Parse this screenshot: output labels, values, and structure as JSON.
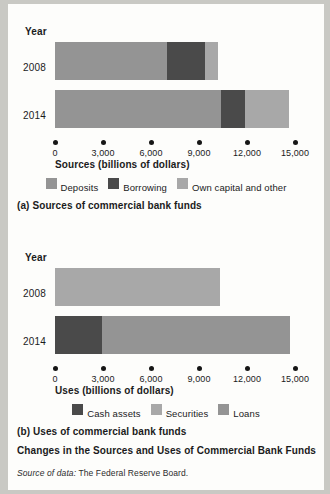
{
  "figure": {
    "main_caption": "Changes in the Sources and Uses of Commercial Bank Funds",
    "source_note_lead": "Source of data:",
    "source_note_rest": " The Federal Reserve Board."
  },
  "colors": {
    "dark": "#4a4a4a",
    "mid": "#949494",
    "light": "#a8a8a8",
    "text": "#1b1b1b",
    "page": "#fdfdfb",
    "backdrop": "#c9c9c4"
  },
  "chart_data": [
    {
      "id": "sources",
      "type": "bar",
      "orientation": "horizontal",
      "stacked": true,
      "title": "(a) Sources of commercial bank funds",
      "year_axis_label": "Year",
      "xlabel": "Sources (billions of dollars)",
      "ylabel": "Year",
      "categories": [
        "2008",
        "2014"
      ],
      "xlim": [
        0,
        15000
      ],
      "xticks": [
        0,
        3000,
        6000,
        9000,
        12000,
        15000
      ],
      "xticklabels": [
        "0",
        "3,000",
        "6,000",
        "9,000",
        "12,000",
        "15,000"
      ],
      "grid": false,
      "legend_position": "below-axis",
      "series": [
        {
          "name": "Deposits",
          "color": "#949494",
          "values": [
            7000,
            10400
          ]
        },
        {
          "name": "Borrowing",
          "color": "#4a4a4a",
          "values": [
            2375,
            1500
          ]
        },
        {
          "name": "Own capital and other",
          "color": "#a8a8a8",
          "values": [
            825,
            2700
          ]
        }
      ],
      "totals": [
        10200,
        14600
      ]
    },
    {
      "id": "uses",
      "type": "bar",
      "orientation": "horizontal",
      "stacked": true,
      "title": "(b) Uses of commercial bank funds",
      "year_axis_label": "Year",
      "xlabel": "Uses (billions of dollars)",
      "ylabel": "Year",
      "categories": [
        "2008",
        "2014"
      ],
      "xlim": [
        0,
        15000
      ],
      "xticks": [
        0,
        3000,
        6000,
        9000,
        12000,
        15000
      ],
      "xticklabels": [
        "0",
        "3,000",
        "6,000",
        "9,000",
        "12,000",
        "15,000"
      ],
      "grid": false,
      "legend_position": "below-axis",
      "series": [
        {
          "name": "Cash assets",
          "color": "#4a4a4a",
          "values": [
            0,
            2950
          ]
        },
        {
          "name": "Securities",
          "color": "#a8a8a8",
          "values": [
            10300,
            0
          ]
        },
        {
          "name": "Loans",
          "color": "#949494",
          "values": [
            0,
            11750
          ]
        }
      ],
      "totals": [
        10300,
        14700
      ]
    }
  ]
}
